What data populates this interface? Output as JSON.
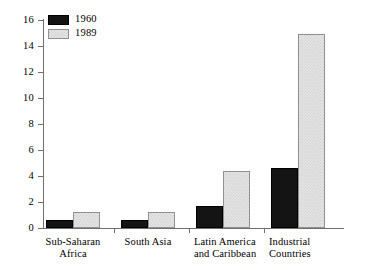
{
  "chart_data": {
    "type": "bar",
    "title": "",
    "subtitle": "",
    "xlabel": "",
    "ylabel": "",
    "grid": false,
    "legend_position": "top-left",
    "categories": [
      "Sub-Saharan\nAfrica",
      "South Asia",
      "Latin America\nand Caribbean",
      "Industrial\nCountries"
    ],
    "series": [
      {
        "name": "1960",
        "color": "#141414",
        "values": [
          0.6,
          0.6,
          1.7,
          4.6
        ]
      },
      {
        "name": "1989",
        "color": "#e6e6e6",
        "values": [
          1.2,
          1.2,
          4.4,
          14.9
        ]
      }
    ],
    "ylim": [
      0,
      16
    ],
    "yticks": [
      0,
      2,
      4,
      6,
      8,
      10,
      12,
      14,
      16
    ],
    "ytick_labels": [
      "0",
      "2",
      "4",
      "6",
      "8",
      "10",
      "12",
      "14",
      "16"
    ]
  },
  "legend": {
    "items": [
      {
        "label": "1960"
      },
      {
        "label": "1989"
      }
    ]
  }
}
